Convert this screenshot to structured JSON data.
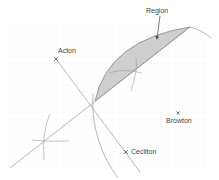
{
  "diagram": {
    "type": "locus-construction",
    "labels": {
      "region": "Region",
      "acton": "Acton",
      "browton": "Browton",
      "cecilton": "Cecilton"
    },
    "points": {
      "acton": {
        "x": 56,
        "y": 59
      },
      "browton": {
        "x": 178,
        "y": 113
      },
      "cecilton": {
        "x": 126,
        "y": 152
      }
    },
    "colors": {
      "region_fill": "#cfcfcf",
      "line": "#8a8a8a",
      "grid": "#f0f0f0",
      "text": "#444444"
    }
  }
}
